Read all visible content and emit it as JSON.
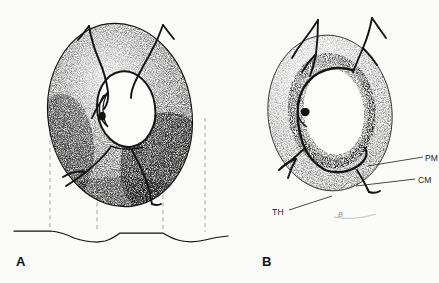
{
  "figure": {
    "background_color": "#fbfbfa",
    "ink_color": "#111111",
    "stipple_color": "#2a2a2a",
    "width": 439,
    "height": 283,
    "style": "stippled scientific line illustration, two panels"
  },
  "panels": [
    {
      "id": "A",
      "letter": "A",
      "description": "Whole stippled toroidal structure in oblique view with branching surface fibers, dashed vertical projection lines descending to a scalloped baseline profile",
      "center_x": 120,
      "center_y": 115,
      "outer_rx": 72,
      "outer_ry": 92,
      "inner_rx": 29,
      "inner_ry": 38,
      "rotation_deg": -8
    },
    {
      "id": "B",
      "letter": "B",
      "description": "Same structure with concentric wall layers labelled; light outer zone, dense dark middle band, pale inner lining around white lumen",
      "center_x": 330,
      "center_y": 113,
      "outer_rx": 62,
      "outer_ry": 78,
      "inner_rx": 33,
      "inner_ry": 47,
      "rotation_deg": -6
    }
  ],
  "labels": [
    {
      "key": "pm",
      "text": "PM",
      "panel": "B",
      "meaning": "inner pale lining layer",
      "leader_from_x": 424,
      "leader_from_y": 157,
      "leader_to_x": 368,
      "leader_to_y": 166
    },
    {
      "key": "cm",
      "text": "CM",
      "panel": "B",
      "meaning": "dense dark middle band",
      "leader_from_x": 416,
      "leader_from_y": 179,
      "leader_to_x": 356,
      "leader_to_y": 186
    },
    {
      "key": "th",
      "text": "TH",
      "panel": "B",
      "meaning": "light outer zone",
      "leader_from_x": 288,
      "leader_from_y": 210,
      "leader_to_x": 330,
      "leader_to_y": 196
    },
    {
      "key": "b",
      "text": "B",
      "panel": "B",
      "meaning": "faint bracket marking basal extent",
      "leader_from_x": 332,
      "leader_from_y": 216,
      "leader_to_x": 372,
      "leader_to_y": 214
    }
  ],
  "projection_lines": {
    "style": "dashed",
    "color": "#9a9a9a",
    "top_y": 112,
    "bottom_y": 233,
    "x_positions": [
      50,
      97,
      163,
      205
    ]
  },
  "baseline": {
    "description": "horizontal profile trace with three shallow scalloped dips aligned to the dashed projection lines",
    "color": "#111111",
    "y": 233,
    "x_start": 14,
    "x_end": 228,
    "dip_depth": 9
  }
}
